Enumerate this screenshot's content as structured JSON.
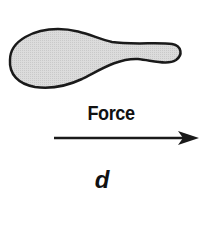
{
  "diagram": {
    "object": {
      "shape": "paddle-shaped blob",
      "fill": "#d9d9d9",
      "stroke": "#1a1a1a"
    },
    "force_label": "Force",
    "arrow": {
      "direction": "right",
      "color": "#1a1a1a"
    },
    "displacement_label": "d"
  }
}
